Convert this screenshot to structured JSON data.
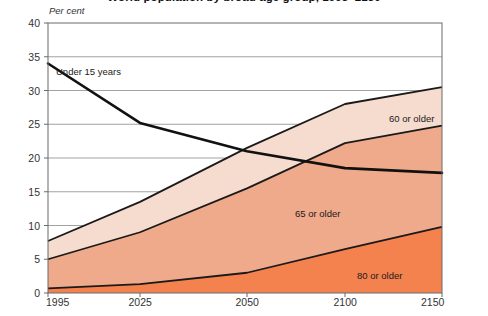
{
  "chart_data": {
    "type": "area",
    "title": "World population by broad age group, 1995–2150",
    "ylabel": "Per cent",
    "xlabel": "",
    "ylim": [
      0,
      40
    ],
    "ytick_values": [
      0,
      5,
      10,
      15,
      20,
      25,
      30,
      35,
      40
    ],
    "ytick_labels": [
      "0",
      "5",
      "10",
      "15",
      "20",
      "25",
      "30",
      "35",
      "40"
    ],
    "x": [
      1995,
      2025,
      2050,
      2100,
      2150
    ],
    "xtick_labels": [
      "1995",
      "2025",
      "2050",
      "2100",
      "2150"
    ],
    "grid": true,
    "legend_position": "inline-annotations",
    "series": [
      {
        "name": "60 or older",
        "label": "60 or older",
        "style": "area",
        "color": "#F6DCCE",
        "line_color": "#1a1a1a",
        "values": [
          7.7,
          13.5,
          21.5,
          28.0,
          30.5
        ]
      },
      {
        "name": "65 or older",
        "label": "65 or older",
        "style": "area",
        "color": "#EFA98B",
        "line_color": "#1a1a1a",
        "values": [
          5.0,
          9.0,
          15.5,
          22.2,
          24.8
        ]
      },
      {
        "name": "80 or older",
        "label": "80 or older",
        "style": "area",
        "color": "#F4824F",
        "line_color": "#1a1a1a",
        "values": [
          0.7,
          1.3,
          3.0,
          6.5,
          9.8
        ]
      },
      {
        "name": "Under 15 years",
        "label": "Under 15 years",
        "style": "line",
        "color": "none",
        "line_color": "#111111",
        "values": [
          34.0,
          25.2,
          21.0,
          18.5,
          17.8
        ]
      }
    ],
    "annotations": [
      {
        "text": "Under 15 years",
        "x_px": 56,
        "y_px": 66
      },
      {
        "text": "60 or older",
        "x_px": 389,
        "y_px": 113
      },
      {
        "text": "65 or older",
        "x_px": 295,
        "y_px": 208
      },
      {
        "text": "80 or older",
        "x_px": 357,
        "y_px": 270
      }
    ],
    "colors": {
      "band_60_plus": "#F6DCCE",
      "band_65_plus": "#EFA98B",
      "band_80_plus": "#F4824F",
      "axis": "#6b6b6b",
      "gridline": "#8a8a8a",
      "series_line": "#111111",
      "background": "#ffffff"
    },
    "plot_box_px": {
      "left": 48,
      "right": 442,
      "top": 23,
      "bottom": 293
    }
  }
}
